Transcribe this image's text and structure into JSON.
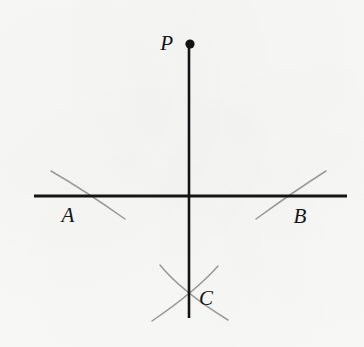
{
  "figure": {
    "background_color": "#f8f8f7",
    "width": 364,
    "height": 347,
    "line_color": "#141414",
    "arc_color": "#9a9a9a",
    "label_color": "#151515"
  },
  "labels": {
    "p": "P",
    "a": "A",
    "b": "B",
    "c": "C"
  },
  "points": {
    "p": {
      "x": 190,
      "y": 44,
      "radius": 4.6,
      "label_x": 173,
      "label_y": 50
    },
    "a": {
      "x": 79,
      "y": 196,
      "label_x": 68,
      "label_y": 222
    },
    "b": {
      "x": 297,
      "y": 196,
      "label_x": 300,
      "label_y": 223
    },
    "c": {
      "x": 188,
      "y": 296,
      "label_x": 199,
      "label_y": 305
    },
    "intersection": {
      "x": 189,
      "y": 196
    }
  },
  "lines": {
    "vertical": {
      "x": 189,
      "y1": 44,
      "y2": 318,
      "width": 2.6
    },
    "horizontal": {
      "y": 196,
      "x1": 34,
      "x2": 347,
      "width": 2.8
    }
  },
  "arcs": {
    "arc_a": "M 51 171 Q 84 190 125 219",
    "arc_b": "M 256 219 Q 296 190 326 171",
    "arc_c_left": "M 160 265 Q 181 291 228 320",
    "arc_c_right": "M 218 266 Q 196 291 152 321",
    "stroke_width": 1.5
  }
}
